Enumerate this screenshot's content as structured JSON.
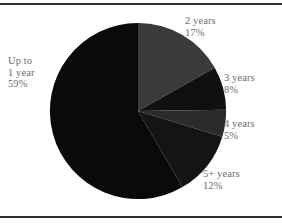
{
  "figure": {
    "background_color": "#ffffff",
    "rule_color": "#2e2e2e",
    "label_text_color": "#6d6d6d"
  },
  "chart_data": {
    "type": "pie",
    "title": "",
    "subtitle": "",
    "xlabel": "",
    "ylabel": "",
    "legend_position": "none",
    "grid": false,
    "start_angle_deg": 0,
    "direction": "clockwise",
    "units": "percent",
    "categories": [
      "2 years",
      "3 years",
      "4 years",
      "5+ years",
      "Up to 1 year"
    ],
    "values": [
      17,
      8,
      5,
      12,
      59
    ],
    "slices": [
      {
        "label": "2 years",
        "value": 17,
        "value_label": "17%",
        "color": "#3a3a3a",
        "label_lines": [
          "2 years",
          "17%"
        ]
      },
      {
        "label": "3 years",
        "value": 8,
        "value_label": "8%",
        "color": "#101010",
        "label_lines": [
          "3 years",
          "8%"
        ]
      },
      {
        "label": "4 years",
        "value": 5,
        "value_label": "5%",
        "color": "#2b2b2b",
        "label_lines": [
          "4 years",
          "5%"
        ]
      },
      {
        "label": "5+ years",
        "value": 12,
        "value_label": "12%",
        "color": "#141414",
        "label_lines": [
          "5+ years",
          "12%"
        ]
      },
      {
        "label": "Up to 1 year",
        "value": 59,
        "value_label": "59%",
        "color": "#0a0a0a",
        "label_lines": [
          "Up to",
          "1 year",
          "59%"
        ]
      }
    ]
  }
}
